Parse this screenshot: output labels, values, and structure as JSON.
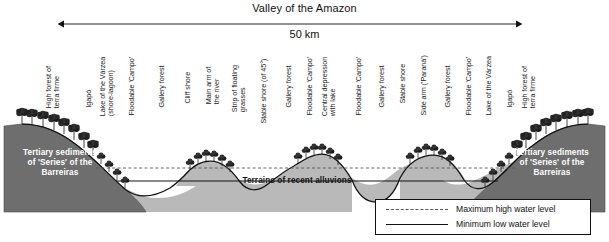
{
  "scale": {
    "caption": "Valley of the Amazon",
    "distance": "50 km"
  },
  "features": [
    {
      "x": 64,
      "lines": [
        "High forest of",
        "terra firme"
      ]
    },
    {
      "x": 97,
      "lines": [
        "Igapó"
      ]
    },
    {
      "x": 118,
      "lines": [
        "Lake of the Várzea",
        "(shore-lagoon)"
      ]
    },
    {
      "x": 140,
      "lines": [
        "Floodable 'Campo'"
      ]
    },
    {
      "x": 170,
      "lines": [
        "Gallery forest"
      ]
    },
    {
      "x": 196,
      "lines": [
        "Cliff shore"
      ]
    },
    {
      "x": 224,
      "lines": [
        "Main arm of",
        "the river"
      ]
    },
    {
      "x": 250,
      "lines": [
        "Strip of floating",
        "grasses"
      ]
    },
    {
      "x": 272,
      "lines": [
        "Stable shore (of 45°)"
      ]
    },
    {
      "x": 297,
      "lines": [
        "Gallery forest"
      ]
    },
    {
      "x": 318,
      "lines": [
        "Floodable 'Campo'"
      ]
    },
    {
      "x": 340,
      "lines": [
        "Central depression",
        "with lake"
      ]
    },
    {
      "x": 367,
      "lines": [
        "Floodable 'Campo'"
      ]
    },
    {
      "x": 390,
      "lines": [
        "Gallery forest"
      ]
    },
    {
      "x": 411,
      "lines": [
        "Stable shore"
      ]
    },
    {
      "x": 432,
      "lines": [
        "Side arm ('Paraná')"
      ]
    },
    {
      "x": 456,
      "lines": [
        "Gallery forest"
      ]
    },
    {
      "x": 477,
      "lines": [
        "Floodable 'Campo'"
      ]
    },
    {
      "x": 497,
      "lines": [
        "Lake of the Várzea"
      ]
    },
    {
      "x": 518,
      "lines": [
        "Igapó"
      ]
    },
    {
      "x": 540,
      "lines": [
        "High forest of",
        "terra firme"
      ]
    }
  ],
  "geology": [
    {
      "id": "tertiary-left",
      "lines": [
        "Tertiary sediments",
        "of 'Series' of the",
        "Barreiras"
      ],
      "x": 8,
      "y": 148,
      "width": 104,
      "tone": "dark"
    },
    {
      "id": "alluvions",
      "lines": [
        "Terrains of recent alluvions"
      ],
      "x": 222,
      "y": 176,
      "width": 150,
      "tone": "light"
    },
    {
      "id": "tertiary-right",
      "lines": [
        "Tertiary sediments",
        "of 'Series' of the",
        "Barreiras"
      ],
      "x": 500,
      "y": 148,
      "width": 104,
      "tone": "dark"
    }
  ],
  "legend": {
    "items": [
      {
        "style": "dashed",
        "label": "Maximum high water level"
      },
      {
        "style": "solid",
        "label": "Minimum low water level"
      }
    ]
  },
  "colors": {
    "tertiary_fill": "#6e6e6e",
    "alluvion_fill": "#b9b9b9",
    "outline": "#111111",
    "water_high": "#555555",
    "water_low": "#111111",
    "background": "#ffffff"
  }
}
